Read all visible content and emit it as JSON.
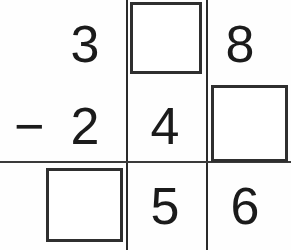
{
  "problem": {
    "type": "vertical-subtraction",
    "operator": "−",
    "rows": {
      "minuend": {
        "hundreds": "3",
        "tens": "",
        "ones": "8"
      },
      "subtrahend": {
        "hundreds": "",
        "tens": "2",
        "ones": ""
      },
      "difference": {
        "hundreds": "",
        "tens": "5",
        "ones": "6"
      }
    },
    "middle_digit": "4"
  },
  "colors": {
    "ink": "#1b1b1b",
    "rule": "#2a2a2a",
    "box_border": "#2f2f2f",
    "background": "#fefefe"
  }
}
